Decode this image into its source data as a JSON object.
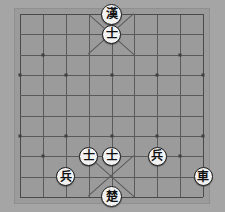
{
  "app": {
    "title": "Xiangqi Board",
    "board_type": "xiangqi"
  },
  "colors": {
    "background": "#a5a5a5",
    "board": "#9b9b9b",
    "line": "#5a5a5a",
    "edge_line": "#4a4a4a",
    "star_point": "#3f3f3f",
    "piece_face": "#f2f2f2",
    "piece_border": "#1c1c1c",
    "piece_text": "#111111"
  },
  "board": {
    "files": 9,
    "ranks": 10,
    "origin_x": 20,
    "origin_y": 14,
    "cell_w": 22.875,
    "cell_h": 20.333,
    "star_points": [
      {
        "file": 1,
        "rank": 2
      },
      {
        "file": 7,
        "rank": 2
      },
      {
        "file": 1,
        "rank": 7
      },
      {
        "file": 7,
        "rank": 7
      },
      {
        "file": 0,
        "rank": 3
      },
      {
        "file": 2,
        "rank": 3
      },
      {
        "file": 4,
        "rank": 3
      },
      {
        "file": 6,
        "rank": 3
      },
      {
        "file": 8,
        "rank": 3
      },
      {
        "file": 0,
        "rank": 6
      },
      {
        "file": 2,
        "rank": 6
      },
      {
        "file": 4,
        "rank": 6
      },
      {
        "file": 6,
        "rank": 6
      },
      {
        "file": 8,
        "rank": 6
      }
    ],
    "palaces": [
      {
        "name": "top-palace",
        "file_from": 3,
        "file_to": 5,
        "rank_from": 0,
        "rank_to": 2
      },
      {
        "name": "bottom-palace",
        "file_from": 3,
        "file_to": 5,
        "rank_from": 7,
        "rank_to": 9
      }
    ]
  },
  "pieces": [
    {
      "id": "black-general",
      "glyph": "漢",
      "name": "piece-han-general",
      "side": "black",
      "file": 4,
      "rank": 0,
      "general": true
    },
    {
      "id": "black-advisor-1",
      "glyph": "士",
      "name": "piece-advisor",
      "side": "black",
      "file": 4,
      "rank": 1,
      "general": false
    },
    {
      "id": "red-advisor-1",
      "glyph": "士",
      "name": "piece-advisor",
      "side": "red",
      "file": 3,
      "rank": 7,
      "general": false
    },
    {
      "id": "red-advisor-2",
      "glyph": "士",
      "name": "piece-advisor",
      "side": "red",
      "file": 4,
      "rank": 7,
      "general": false
    },
    {
      "id": "red-soldier-1",
      "glyph": "兵",
      "name": "piece-soldier",
      "side": "red",
      "file": 6,
      "rank": 7,
      "general": false
    },
    {
      "id": "red-soldier-2",
      "glyph": "兵",
      "name": "piece-soldier",
      "side": "red",
      "file": 2,
      "rank": 8,
      "general": false
    },
    {
      "id": "red-chariot-1",
      "glyph": "車",
      "name": "piece-chariot",
      "side": "red",
      "file": 8,
      "rank": 8,
      "general": false
    },
    {
      "id": "red-general",
      "glyph": "楚",
      "name": "piece-chu-general",
      "side": "red",
      "file": 4,
      "rank": 9,
      "general": true
    }
  ]
}
